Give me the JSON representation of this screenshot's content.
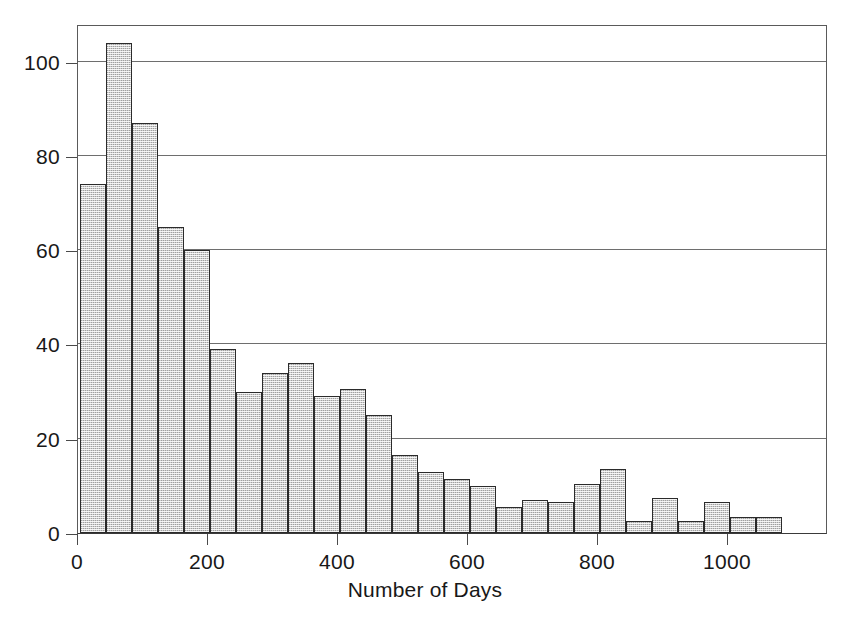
{
  "chart_data": {
    "type": "bar",
    "title": "",
    "subtitle": "",
    "xlabel": "Number of Days",
    "ylabel": "",
    "grid": true,
    "legend": false,
    "legend_position": "none",
    "bin_width": 40,
    "xlim": [
      0,
      1154
    ],
    "ylim": [
      0,
      108
    ],
    "x_ticks": [
      0,
      200,
      400,
      600,
      800,
      1000
    ],
    "x_tick_labels": [
      "0",
      "200",
      "400",
      "600",
      "800",
      "1000"
    ],
    "y_ticks": [
      0,
      20,
      40,
      60,
      80,
      100
    ],
    "y_tick_labels": [
      "0",
      "20",
      "40",
      "60",
      "80",
      "100"
    ],
    "bin_starts": [
      3,
      43,
      83,
      123,
      163,
      203,
      243,
      283,
      323,
      363,
      403,
      443,
      483,
      523,
      563,
      603,
      643,
      683,
      723,
      763,
      803,
      843,
      883,
      923,
      963,
      1003,
      1043
    ],
    "categories": [
      "3-43",
      "43-83",
      "83-123",
      "123-163",
      "163-203",
      "203-243",
      "243-283",
      "283-323",
      "323-363",
      "363-403",
      "403-443",
      "443-483",
      "483-523",
      "523-563",
      "563-603",
      "603-643",
      "643-683",
      "683-723",
      "723-763",
      "763-803",
      "803-843",
      "843-883",
      "883-923",
      "923-963",
      "963-1003",
      "1003-1043",
      "1043-1083"
    ],
    "values": [
      74,
      104,
      87,
      65,
      60,
      39,
      30,
      34,
      36,
      29,
      30.5,
      25,
      16.5,
      13,
      11.5,
      10,
      5.5,
      7,
      6.5,
      10.5,
      13.5,
      2.5,
      7.5,
      2.5,
      6.5,
      3.5,
      3.5
    ],
    "bar_fill_color": "#cfcfcf",
    "bar_edge_color": "#2b2b2b",
    "grid_color": "#6e6e6e",
    "axis_color": "#4a4a4a",
    "background_color": "#ffffff"
  },
  "figure": {
    "caption": ""
  }
}
